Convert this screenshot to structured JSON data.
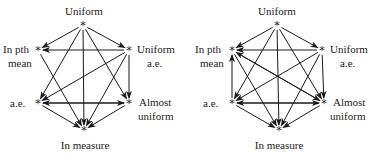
{
  "diagrams": [
    {
      "name": "left",
      "nodes": {
        "uniform": {
          "label": "Uniform",
          "x": 83,
          "y": 25
        },
        "pth": {
          "label1": "In pth",
          "label2": "mean",
          "x": 38,
          "y": 50
        },
        "uae": {
          "label1": "Uniform",
          "label2": "a.e.",
          "x": 129,
          "y": 50
        },
        "ae": {
          "label": "a.e.",
          "x": 38,
          "y": 103
        },
        "au": {
          "label1": "Almost",
          "label2": "uniform",
          "x": 129,
          "y": 103
        },
        "im": {
          "label": "In measure",
          "x": 84,
          "y": 130
        }
      },
      "edges": [
        [
          "uniform",
          "pth"
        ],
        [
          "uniform",
          "uae"
        ],
        [
          "uniform",
          "ae"
        ],
        [
          "uniform",
          "au"
        ],
        [
          "uniform",
          "im"
        ],
        [
          "uae",
          "pth"
        ],
        [
          "uae",
          "ae"
        ],
        [
          "uae",
          "au"
        ],
        [
          "uae",
          "im"
        ],
        [
          "pth",
          "im"
        ],
        [
          "ae",
          "au"
        ],
        [
          "au",
          "ae"
        ],
        [
          "ae",
          "im"
        ],
        [
          "au",
          "im"
        ]
      ]
    },
    {
      "name": "right",
      "nodes": {
        "uniform": {
          "label": "Uniform",
          "x": 277,
          "y": 25
        },
        "pth": {
          "label1": "In pth",
          "label2": "mean",
          "x": 232,
          "y": 50
        },
        "uae": {
          "label1": "Uniform",
          "label2": "a.e.",
          "x": 322,
          "y": 50
        },
        "ae": {
          "label": "a.e.",
          "x": 232,
          "y": 103
        },
        "au": {
          "label1": "Almost",
          "label2": "uniform",
          "x": 324,
          "y": 103
        },
        "im": {
          "label": "In measure",
          "x": 279,
          "y": 130
        }
      },
      "edges": [
        [
          "uniform",
          "pth"
        ],
        [
          "uniform",
          "uae"
        ],
        [
          "uniform",
          "ae"
        ],
        [
          "uniform",
          "au"
        ],
        [
          "uniform",
          "im"
        ],
        [
          "uae",
          "pth"
        ],
        [
          "uae",
          "ae"
        ],
        [
          "uae",
          "au"
        ],
        [
          "uae",
          "im"
        ],
        [
          "ae",
          "pth"
        ],
        [
          "pth",
          "au"
        ],
        [
          "au",
          "pth"
        ],
        [
          "pth",
          "im"
        ],
        [
          "ae",
          "au"
        ],
        [
          "au",
          "ae"
        ],
        [
          "ae",
          "im"
        ],
        [
          "au",
          "im"
        ]
      ]
    }
  ]
}
